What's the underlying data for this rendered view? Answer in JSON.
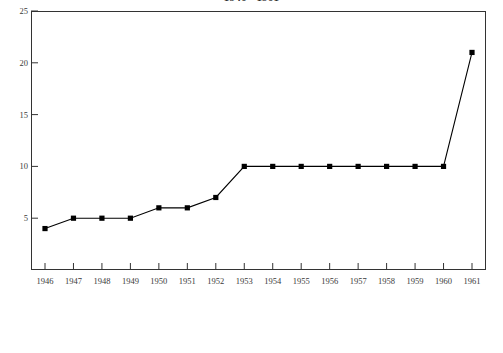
{
  "chart_data": {
    "type": "line",
    "title": "1946 - 1961",
    "title_clipped": true,
    "xlabel": "",
    "ylabel": "",
    "categories": [
      "1946",
      "1947",
      "1948",
      "1949",
      "1950",
      "1951",
      "1952",
      "1953",
      "1954",
      "1955",
      "1956",
      "1957",
      "1958",
      "1959",
      "1960",
      "1961"
    ],
    "values": [
      4,
      5,
      5,
      5,
      6,
      6,
      7,
      10,
      10,
      10,
      10,
      10,
      10,
      10,
      10,
      21
    ],
    "series": [
      {
        "name": "series-1",
        "values": [
          4,
          5,
          5,
          5,
          6,
          6,
          7,
          10,
          10,
          10,
          10,
          10,
          10,
          10,
          10,
          21
        ],
        "color": "#000000",
        "marker": "square",
        "marker_color": "#000000"
      }
    ],
    "ylim": [
      0,
      25
    ],
    "y_ticks": [
      5,
      10,
      15,
      20,
      25
    ],
    "y_tick_labels": [
      "5",
      "10",
      "15",
      "20",
      "25"
    ],
    "x_ticks": [
      "1946",
      "1947",
      "1948",
      "1949",
      "1950",
      "1951",
      "1952",
      "1953",
      "1954",
      "1955",
      "1956",
      "1957",
      "1958",
      "1959",
      "1960",
      "1961"
    ],
    "grid": false,
    "legend": null,
    "legend_position": "none",
    "frame": "full-box",
    "tick_direction": "in",
    "background_color": "#ffffff",
    "axis_color": "#333333",
    "line_color": "#000000"
  }
}
